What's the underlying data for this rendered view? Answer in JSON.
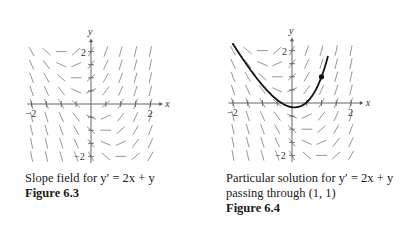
{
  "figures": [
    {
      "id": "figure-6-3",
      "caption": "Slope field for y′ = 2x + y",
      "label": "Figure 6.3",
      "axis_labels": {
        "x": "x",
        "y": "y"
      },
      "tick_labels": {
        "x_neg": "−2",
        "x_pos": "2",
        "y_pos": "2",
        "y_neg": "−2"
      }
    },
    {
      "id": "figure-6-4",
      "caption_line1": "Particular solution for y′ = 2x + y",
      "caption_line2": "passing through (1, 1)",
      "label": "Figure 6.4",
      "axis_labels": {
        "x": "x",
        "y": "y"
      },
      "tick_labels": {
        "x_neg": "−2",
        "x_pos": "2",
        "y_pos": "2",
        "y_neg": "−2"
      }
    }
  ],
  "chart_data": [
    {
      "type": "scatter",
      "title": "Slope field for y' = 2x + y",
      "subtype": "slope_field",
      "equation": "y' = 2x + y",
      "x_range": [
        -2,
        2
      ],
      "y_range": [
        -2,
        2
      ],
      "grid_step": 0.5,
      "xlabel": "x",
      "ylabel": "y",
      "x_ticks": [
        -2,
        2
      ],
      "y_ticks": [
        -2,
        2
      ]
    },
    {
      "type": "line",
      "title": "Particular solution for y' = 2x + y passing through (1, 1)",
      "equation": "y' = 2x + y",
      "solution": "y = (5/e)e^x - 2x - 2",
      "point": [
        1,
        1
      ],
      "x": [
        -2,
        -1.5,
        -1,
        -0.5,
        0,
        0.5,
        1,
        1.2
      ],
      "y": [
        2.25,
        1.41,
        0.68,
        0.12,
        -0.16,
        0.03,
        1.0,
        1.71
      ],
      "x_range": [
        -2,
        2
      ],
      "y_range": [
        -2,
        2
      ],
      "xlabel": "x",
      "ylabel": "y",
      "x_ticks": [
        -2,
        2
      ],
      "y_ticks": [
        -2,
        2
      ]
    }
  ]
}
